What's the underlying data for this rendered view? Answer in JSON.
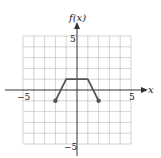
{
  "chart_data": {
    "type": "line",
    "title": "",
    "xlabel": "x",
    "ylabel": "f(x)",
    "xlim": [
      -5,
      5
    ],
    "ylim": [
      -5,
      5
    ],
    "grid": true,
    "tick_labels": {
      "x_min": "−5",
      "x_max": "5",
      "y_max": "5",
      "y_min": "−5"
    },
    "series": [
      {
        "name": "f(x)",
        "x": [
          -2,
          -1,
          1,
          2
        ],
        "y": [
          -1,
          1,
          1,
          -1
        ],
        "endpoints": "closed"
      }
    ]
  },
  "colors": {
    "grid": "#c8c8c8",
    "axis": "#333333",
    "curve": "#555555"
  }
}
